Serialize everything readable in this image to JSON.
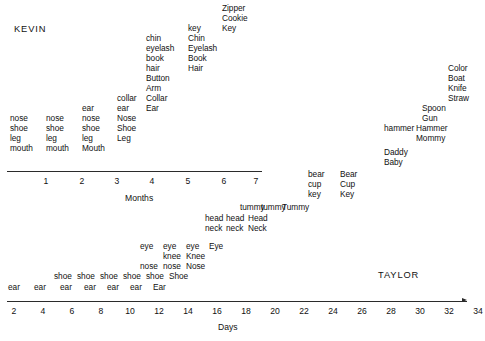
{
  "figure": {
    "background": "#ffffff",
    "ink": "#111111",
    "width": 485,
    "height": 341
  },
  "subjects": [
    {
      "name": "KEVIN",
      "x": 14,
      "y": 24
    },
    {
      "name": "TAYLOR",
      "x": 378,
      "y": 270
    }
  ],
  "axes": [
    {
      "id": "months-axis",
      "title": "Months",
      "title_x": 125,
      "title_y": 193,
      "line": {
        "x": 7,
        "y": 171,
        "width": 255
      },
      "ticks": [
        {
          "label": "1",
          "x": 46
        },
        {
          "label": "2",
          "x": 82
        },
        {
          "label": "3",
          "x": 117
        },
        {
          "label": "4",
          "x": 152
        },
        {
          "label": "5",
          "x": 188
        },
        {
          "label": "6",
          "x": 224
        },
        {
          "label": "7",
          "x": 256
        }
      ],
      "tick_y": 176
    },
    {
      "id": "days-axis",
      "title": "Days",
      "title_x": 218,
      "title_y": 322,
      "line": {
        "x": 7,
        "y": 301,
        "width": 460
      },
      "arrow": {
        "x": 462,
        "y": 298
      },
      "ticks": [
        {
          "label": "2",
          "x": 14
        },
        {
          "label": "4",
          "x": 43
        },
        {
          "label": "6",
          "x": 72
        },
        {
          "label": "8",
          "x": 101
        },
        {
          "label": "10",
          "x": 130
        },
        {
          "label": "12",
          "x": 159
        },
        {
          "label": "14",
          "x": 188
        },
        {
          "label": "16",
          "x": 217
        },
        {
          "label": "18",
          "x": 246
        },
        {
          "label": "20",
          "x": 275
        },
        {
          "label": "22",
          "x": 304
        },
        {
          "label": "24",
          "x": 333
        },
        {
          "label": "26",
          "x": 362
        },
        {
          "label": "28",
          "x": 391
        },
        {
          "label": "30",
          "x": 420
        },
        {
          "label": "32",
          "x": 449
        },
        {
          "label": "34",
          "x": 478
        },
        {
          "label": "36",
          "x": 507
        },
        {
          "label": "38",
          "x": 536
        }
      ],
      "tick_y": 306
    }
  ],
  "chart_data": {
    "type": "scatter",
    "title": "",
    "xlabel": "Months / Days",
    "ylabel": "",
    "panels": [
      {
        "subject": "KEVIN",
        "axis": "Months",
        "columns": [
          {
            "x": 10,
            "time": 1,
            "words": [
              "nose",
              "shoe",
              "leg",
              "mouth"
            ]
          },
          {
            "x": 46,
            "time": 2,
            "words": [
              "nose",
              "shoe",
              "leg",
              "mouth"
            ]
          },
          {
            "x": 82,
            "time": 3,
            "words": [
              "ear",
              "nose",
              "shoe",
              "leg"
            ]
          },
          {
            "x": 82,
            "time": 3,
            "words_caps": [
              "Mouth"
            ]
          },
          {
            "x": 117,
            "time": 4,
            "words": [
              "collar",
              "ear"
            ]
          },
          {
            "x": 117,
            "time": 4,
            "words_caps": [
              "Nose",
              "Shoe",
              "Leg"
            ]
          },
          {
            "x": 146,
            "time": 4.8,
            "words": [
              "chin",
              "eyelash",
              "book",
              "hair"
            ]
          },
          {
            "x": 146,
            "time": 4.8,
            "words_caps": [
              "Button",
              "Arm",
              "Collar",
              "Ear"
            ]
          },
          {
            "x": 188,
            "time": 5.9,
            "words": [
              "key"
            ]
          },
          {
            "x": 188,
            "time": 5.9,
            "words_caps": [
              "Chin",
              "Eyelash",
              "Book",
              "Hair"
            ]
          },
          {
            "x": 222,
            "time": 6.9,
            "words_caps": [
              "Zipper",
              "Cookie",
              "Key"
            ]
          }
        ]
      },
      {
        "subject": "TAYLOR",
        "axis": "Days",
        "columns": [
          {
            "x": 8,
            "time": 2,
            "words": [
              "ear"
            ]
          },
          {
            "x": 37,
            "time": 4,
            "words": [
              "ear"
            ]
          },
          {
            "x": 54,
            "time": 6,
            "words": [
              "shoe",
              "ear"
            ]
          },
          {
            "x": 83,
            "time": 8,
            "words": [
              "shoe",
              "ear"
            ]
          },
          {
            "x": 105,
            "time": 10,
            "words": [
              "shoe",
              "ear"
            ]
          },
          {
            "x": 128,
            "time": 12,
            "words": [
              "shoe",
              "ear"
            ]
          },
          {
            "x": 140,
            "time": 14,
            "words": [
              "eye",
              "nose",
              "shoe",
              "ear"
            ]
          },
          {
            "x": 163,
            "time": 16,
            "words": [
              "eye",
              "knee",
              "nose",
              "shoe"
            ]
          },
          {
            "x": 186,
            "time": 18,
            "words": [
              "eye",
              "knee",
              "nose",
              "shoe"
            ]
          },
          {
            "x": 186,
            "time": 18,
            "words_caps": [
              "Ear"
            ]
          },
          {
            "x": 209,
            "time": 20,
            "words_caps": [
              "Eye",
              "Knee",
              "Nose",
              "Shoe"
            ]
          },
          {
            "x": 205,
            "time": 20,
            "words": [
              "head",
              "neck"
            ]
          },
          {
            "x": 228,
            "time": 22,
            "words": [
              "head",
              "neck"
            ]
          },
          {
            "x": 250,
            "time": 24,
            "words_caps": [
              "Head",
              "Neck"
            ]
          },
          {
            "x": 238,
            "time": 23,
            "words": [
              "tummy"
            ]
          },
          {
            "x": 259,
            "time": 25,
            "words": [
              "tummy"
            ]
          },
          {
            "x": 280,
            "time": 27,
            "words_caps": [
              "Tummy"
            ]
          },
          {
            "x": 307,
            "time": 28,
            "words": [
              "bear",
              "cup",
              "key"
            ]
          },
          {
            "x": 340,
            "time": 30,
            "words_caps": [
              "Bear",
              "Cup",
              "Key"
            ]
          },
          {
            "x": 355,
            "time": 31,
            "words_caps": [
              "Daddy",
              "Baby"
            ]
          },
          {
            "x": 383,
            "time": 32,
            "words": [
              "hammer"
            ]
          },
          {
            "x": 416,
            "time": 33,
            "words_caps": [
              "Hammer",
              "Mommy"
            ]
          },
          {
            "x": 423,
            "time": 34,
            "words_caps": [
              "Spoon",
              "Gun"
            ]
          },
          {
            "x": 450,
            "time": 36,
            "words_caps": [
              "Color",
              "Boat",
              "Knife",
              "Straw"
            ]
          }
        ]
      }
    ]
  },
  "words": [
    {
      "t": "Zipper",
      "x": 222,
      "y": 4,
      "c": true
    },
    {
      "t": "Cookie",
      "x": 222,
      "y": 14,
      "c": true
    },
    {
      "t": "Key",
      "x": 222,
      "y": 24,
      "c": true
    },
    {
      "t": "key",
      "x": 188,
      "y": 24,
      "c": false
    },
    {
      "t": "Chin",
      "x": 188,
      "y": 34,
      "c": true
    },
    {
      "t": "Eyelash",
      "x": 188,
      "y": 44,
      "c": true
    },
    {
      "t": "Book",
      "x": 188,
      "y": 54,
      "c": true
    },
    {
      "t": "Hair",
      "x": 188,
      "y": 64,
      "c": true
    },
    {
      "t": "chin",
      "x": 146,
      "y": 34,
      "c": false
    },
    {
      "t": "eyelash",
      "x": 146,
      "y": 44,
      "c": false
    },
    {
      "t": "book",
      "x": 146,
      "y": 54,
      "c": false
    },
    {
      "t": "hair",
      "x": 146,
      "y": 64,
      "c": false
    },
    {
      "t": "Button",
      "x": 146,
      "y": 74,
      "c": true
    },
    {
      "t": "Arm",
      "x": 146,
      "y": 84,
      "c": true
    },
    {
      "t": "Collar",
      "x": 146,
      "y": 94,
      "c": true
    },
    {
      "t": "Ear",
      "x": 146,
      "y": 104,
      "c": true
    },
    {
      "t": "collar",
      "x": 117,
      "y": 94,
      "c": false
    },
    {
      "t": "ear",
      "x": 117,
      "y": 104,
      "c": false
    },
    {
      "t": "Nose",
      "x": 117,
      "y": 114,
      "c": true
    },
    {
      "t": "Shoe",
      "x": 117,
      "y": 124,
      "c": true
    },
    {
      "t": "Leg",
      "x": 117,
      "y": 134,
      "c": true
    },
    {
      "t": "ear",
      "x": 82,
      "y": 104,
      "c": false
    },
    {
      "t": "nose",
      "x": 82,
      "y": 114,
      "c": false
    },
    {
      "t": "shoe",
      "x": 82,
      "y": 124,
      "c": false
    },
    {
      "t": "leg",
      "x": 82,
      "y": 134,
      "c": false
    },
    {
      "t": "Mouth",
      "x": 82,
      "y": 144,
      "c": true
    },
    {
      "t": "nose",
      "x": 46,
      "y": 114,
      "c": false
    },
    {
      "t": "shoe",
      "x": 46,
      "y": 124,
      "c": false
    },
    {
      "t": "leg",
      "x": 46,
      "y": 134,
      "c": false
    },
    {
      "t": "mouth",
      "x": 46,
      "y": 144,
      "c": false
    },
    {
      "t": "nose",
      "x": 10,
      "y": 114,
      "c": false
    },
    {
      "t": "shoe",
      "x": 10,
      "y": 124,
      "c": false
    },
    {
      "t": "leg",
      "x": 10,
      "y": 134,
      "c": false
    },
    {
      "t": "mouth",
      "x": 10,
      "y": 144,
      "c": false
    },
    {
      "t": "Color",
      "x": 448,
      "y": 64,
      "c": true
    },
    {
      "t": "Boat",
      "x": 448,
      "y": 74,
      "c": true
    },
    {
      "t": "Knife",
      "x": 448,
      "y": 84,
      "c": true
    },
    {
      "t": "Straw",
      "x": 448,
      "y": 94,
      "c": true
    },
    {
      "t": "Spoon",
      "x": 422,
      "y": 104,
      "c": true
    },
    {
      "t": "Gun",
      "x": 422,
      "y": 114,
      "c": true
    },
    {
      "t": "hammer",
      "x": 384,
      "y": 124,
      "c": false
    },
    {
      "t": "Hammer",
      "x": 416,
      "y": 124,
      "c": true
    },
    {
      "t": "Mommy",
      "x": 416,
      "y": 134,
      "c": true
    },
    {
      "t": "Daddy",
      "x": 384,
      "y": 148,
      "c": true
    },
    {
      "t": "Baby",
      "x": 384,
      "y": 158,
      "c": true
    },
    {
      "t": "bear",
      "x": 308,
      "y": 170,
      "c": false
    },
    {
      "t": "cup",
      "x": 308,
      "y": 180,
      "c": false
    },
    {
      "t": "key",
      "x": 308,
      "y": 190,
      "c": false
    },
    {
      "t": "Bear",
      "x": 340,
      "y": 170,
      "c": true
    },
    {
      "t": "Cup",
      "x": 340,
      "y": 180,
      "c": true
    },
    {
      "t": "Key",
      "x": 340,
      "y": 190,
      "c": true
    },
    {
      "t": "tummy",
      "x": 240,
      "y": 203,
      "c": false
    },
    {
      "t": "tummy",
      "x": 261,
      "y": 203,
      "c": false
    },
    {
      "t": "Tummy",
      "x": 282,
      "y": 203,
      "c": true
    },
    {
      "t": "head",
      "x": 205,
      "y": 214,
      "c": false
    },
    {
      "t": "head",
      "x": 226,
      "y": 214,
      "c": false
    },
    {
      "t": "Head",
      "x": 248,
      "y": 214,
      "c": true
    },
    {
      "t": "neck",
      "x": 205,
      "y": 224,
      "c": false
    },
    {
      "t": "neck",
      "x": 226,
      "y": 224,
      "c": false
    },
    {
      "t": "Neck",
      "x": 248,
      "y": 224,
      "c": true
    },
    {
      "t": "eye",
      "x": 140,
      "y": 242,
      "c": false
    },
    {
      "t": "eye",
      "x": 163,
      "y": 242,
      "c": false
    },
    {
      "t": "eye",
      "x": 186,
      "y": 242,
      "c": false
    },
    {
      "t": "Eye",
      "x": 209,
      "y": 242,
      "c": true
    },
    {
      "t": "knee",
      "x": 163,
      "y": 252,
      "c": false
    },
    {
      "t": "Knee",
      "x": 186,
      "y": 252,
      "c": true
    },
    {
      "t": "nose",
      "x": 140,
      "y": 262,
      "c": false
    },
    {
      "t": "nose",
      "x": 163,
      "y": 262,
      "c": false
    },
    {
      "t": "Nose",
      "x": 186,
      "y": 262,
      "c": true
    },
    {
      "t": "shoe",
      "x": 54,
      "y": 272,
      "c": false
    },
    {
      "t": "shoe",
      "x": 77,
      "y": 272,
      "c": false
    },
    {
      "t": "shoe",
      "x": 100,
      "y": 272,
      "c": false
    },
    {
      "t": "shoe",
      "x": 123,
      "y": 272,
      "c": false
    },
    {
      "t": "shoe",
      "x": 146,
      "y": 272,
      "c": false
    },
    {
      "t": "Shoe",
      "x": 169,
      "y": 272,
      "c": true
    },
    {
      "t": "ear",
      "x": 8,
      "y": 283,
      "c": false
    },
    {
      "t": "ear",
      "x": 34,
      "y": 283,
      "c": false
    },
    {
      "t": "ear",
      "x": 60,
      "y": 283,
      "c": false
    },
    {
      "t": "ear",
      "x": 84,
      "y": 283,
      "c": false
    },
    {
      "t": "ear",
      "x": 107,
      "y": 283,
      "c": false
    },
    {
      "t": "ear",
      "x": 130,
      "y": 283,
      "c": false
    },
    {
      "t": "Ear",
      "x": 153,
      "y": 283,
      "c": true
    }
  ]
}
